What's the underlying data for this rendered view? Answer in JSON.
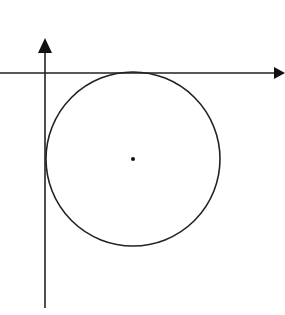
{
  "diagram": {
    "colors": {
      "stroke": "#222222",
      "background": "#ffffff"
    },
    "axes": {
      "origin_px": [
        45,
        73
      ],
      "x_axis": {
        "from_px": [
          0,
          73
        ],
        "to_px": [
          285,
          73
        ],
        "arrow": "right"
      },
      "y_axis": {
        "from_px": [
          45,
          308
        ],
        "to_px": [
          45,
          38
        ],
        "arrow": "up"
      }
    },
    "circle": {
      "center_px": [
        133,
        159
      ],
      "radius_px": 87,
      "tangent_to": [
        "x-axis",
        "y-axis"
      ],
      "center_marked": true
    }
  }
}
